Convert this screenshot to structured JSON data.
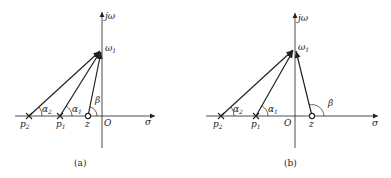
{
  "figure": {
    "panels": [
      {
        "id": "a",
        "caption": "(a)",
        "axis_labels": {
          "imag": "jω",
          "real": "σ",
          "origin": "O"
        },
        "point_label": "ω",
        "point_sub": "1",
        "poles": [
          {
            "label": "p",
            "sub": "2"
          },
          {
            "label": "p",
            "sub": "1"
          }
        ],
        "zero": {
          "label": "z"
        },
        "angles": [
          {
            "label": "α",
            "sub": "2"
          },
          {
            "label": "α",
            "sub": "1"
          },
          {
            "label": "β",
            "sub": ""
          }
        ]
      },
      {
        "id": "b",
        "caption": "(b)",
        "axis_labels": {
          "imag": "jω",
          "real": "σ",
          "origin": "O"
        },
        "point_label": "ω",
        "point_sub": "1",
        "poles": [
          {
            "label": "p",
            "sub": "2"
          },
          {
            "label": "p",
            "sub": "1"
          }
        ],
        "zero": {
          "label": "z"
        },
        "angles": [
          {
            "label": "α",
            "sub": "2"
          },
          {
            "label": "α",
            "sub": "1"
          },
          {
            "label": "β",
            "sub": ""
          }
        ]
      }
    ],
    "colors": {
      "ink": "#222222",
      "background": "#ffffff"
    }
  }
}
